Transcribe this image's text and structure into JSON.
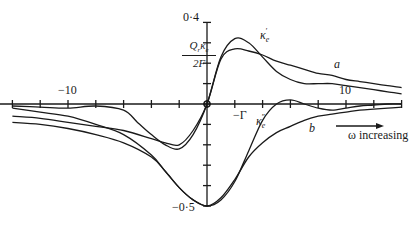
{
  "chart_data": {
    "type": "line",
    "title": "",
    "xlabel": "",
    "ylabel": "Q_r κ_e / 2F",
    "ylabel_parts": {
      "numerator": "Q",
      "numerator_sub": "r",
      "kappa": "κ",
      "kappa_sub": "e",
      "denominator": "2F"
    },
    "xlim": [
      -15,
      14
    ],
    "ylim": [
      -0.5,
      0.4
    ],
    "x_ticks": [
      -14,
      -12,
      -10,
      -8,
      -6,
      -4,
      -2,
      0,
      2,
      4,
      6,
      8,
      10,
      12,
      14
    ],
    "x_tick_labels": [
      {
        "value": -10,
        "label": "−10"
      },
      {
        "value": 10,
        "label": "10"
      }
    ],
    "y_ticks": [
      -0.5,
      -0.4,
      -0.3,
      -0.2,
      -0.1,
      0,
      0.1,
      0.2,
      0.3,
      0.4
    ],
    "y_tick_labels": [
      {
        "value": 0.4,
        "label": "0·4"
      },
      {
        "value": -0.5,
        "label": "−0·5"
      }
    ],
    "grid": false,
    "legend": null,
    "annotations": [
      {
        "text": "κ′e",
        "x": 2.8,
        "y": 0.37,
        "note": "label of real-part curve"
      },
      {
        "text": "κ″e",
        "x": 3.5,
        "y": -0.07,
        "note": "label of imaginary-part curve"
      },
      {
        "text": "a",
        "x": 9.3,
        "y": 0.2,
        "note": "curve a (real part variant)"
      },
      {
        "text": "b",
        "x": 7.3,
        "y": -0.12,
        "note": "curve b (imaginary part variant)"
      },
      {
        "text": "−Γ",
        "x": 2,
        "y": -0.05
      },
      {
        "text": "ω increasing",
        "x": 10,
        "y": -0.12,
        "note": "arrow pointing right"
      }
    ],
    "series": [
      {
        "name": "κ′e (real part, sharp)",
        "x": [
          -14,
          -12,
          -10,
          -8,
          -6,
          -5,
          -4,
          -3,
          -2,
          -1,
          0,
          1,
          2,
          3,
          4,
          5,
          6,
          7,
          8,
          9,
          10,
          11,
          12,
          13,
          14
        ],
        "y": [
          -0.01,
          -0.015,
          -0.02,
          -0.01,
          -0.03,
          -0.09,
          -0.15,
          -0.2,
          -0.22,
          -0.15,
          0,
          0.23,
          0.32,
          0.3,
          0.23,
          0.16,
          0.12,
          0.1,
          0.1,
          0.1,
          0.09,
          0.08,
          0.07,
          0.06,
          0.05
        ]
      },
      {
        "name": "a (real part, broad)",
        "x": [
          -14,
          -12,
          -10,
          -8,
          -6,
          -4,
          -3,
          -2,
          -1,
          0,
          1,
          2,
          3,
          4,
          5,
          6,
          7,
          8,
          9,
          10,
          11,
          12,
          13,
          14
        ],
        "y": [
          -0.06,
          -0.07,
          -0.09,
          -0.11,
          -0.13,
          -0.17,
          -0.19,
          -0.2,
          -0.13,
          0,
          0.22,
          0.27,
          0.26,
          0.24,
          0.21,
          0.19,
          0.17,
          0.15,
          0.14,
          0.12,
          0.11,
          0.1,
          0.09,
          0.08
        ]
      },
      {
        "name": "κ″e (imaginary part, sharp)",
        "x": [
          -14,
          -12,
          -10,
          -8,
          -6,
          -4,
          -3,
          -2,
          -1,
          0,
          1,
          2,
          3,
          4,
          5,
          6,
          7,
          8,
          9,
          10,
          11,
          12,
          13,
          14
        ],
        "y": [
          -0.02,
          -0.04,
          -0.06,
          -0.1,
          -0.15,
          -0.25,
          -0.33,
          -0.41,
          -0.47,
          -0.5,
          -0.47,
          -0.38,
          -0.23,
          -0.08,
          0,
          0.02,
          0,
          -0.02,
          -0.03,
          -0.02,
          -0.01,
          -0.005,
          0,
          0
        ]
      },
      {
        "name": "b (imaginary part, broad)",
        "x": [
          -14,
          -12,
          -10,
          -8,
          -6,
          -4,
          -3,
          -2,
          -1,
          0,
          1,
          2,
          3,
          4,
          5,
          6,
          7,
          8,
          9,
          10,
          11,
          12,
          13,
          14
        ],
        "y": [
          -0.09,
          -0.1,
          -0.12,
          -0.15,
          -0.19,
          -0.26,
          -0.33,
          -0.41,
          -0.47,
          -0.5,
          -0.46,
          -0.37,
          -0.26,
          -0.19,
          -0.14,
          -0.11,
          -0.08,
          -0.06,
          -0.05,
          -0.04,
          -0.03,
          -0.025,
          -0.02,
          -0.015
        ]
      }
    ]
  },
  "labels": {
    "x_neg10": "−10",
    "x_pos10": "10",
    "y_top": "0·4",
    "y_bottom": "−0·5",
    "ylabel_num": "Qrκe",
    "ylabel_den": "2F",
    "kappa_prime": "κ′e",
    "kappa_double_prime": "κ″e",
    "curve_a": "a",
    "curve_b": "b",
    "neg_gamma": "−Γ",
    "omega_increasing": "ω increasing"
  }
}
